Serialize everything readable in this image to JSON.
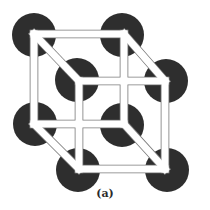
{
  "figure": {
    "caption": "(a)",
    "colors": {
      "atom": "#2e2e2e",
      "frame_fill": "#ffffff",
      "frame_stroke": "#7a7a7a",
      "background": "#ffffff"
    },
    "atom_radius": 22,
    "atoms": [
      {
        "name": "back-top-left",
        "cx": 34,
        "cy": 35
      },
      {
        "name": "back-top-right",
        "cx": 122,
        "cy": 35
      },
      {
        "name": "back-bottom-left",
        "cx": 35,
        "cy": 124
      },
      {
        "name": "back-bottom-right",
        "cx": 122,
        "cy": 125
      },
      {
        "name": "front-top-left",
        "cx": 77,
        "cy": 80
      },
      {
        "name": "front-top-right",
        "cx": 166,
        "cy": 81
      },
      {
        "name": "front-bottom-left",
        "cx": 78,
        "cy": 170
      },
      {
        "name": "front-bottom-right",
        "cx": 167,
        "cy": 170
      }
    ],
    "back_face": {
      "x1": 34,
      "y1": 34,
      "x2": 124,
      "y2": 124
    },
    "front_face": {
      "x1": 79,
      "y1": 81,
      "x2": 165,
      "y2": 169
    },
    "bar_width": 7
  }
}
